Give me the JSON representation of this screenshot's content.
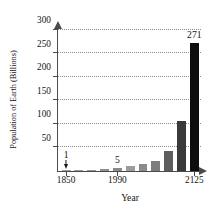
{
  "chart_data": {
    "type": "bar",
    "title": "",
    "xlabel": "Year",
    "ylabel": "Population of Earth (Billions)",
    "xlim": [
      1850,
      2145
    ],
    "ylim": [
      0,
      310
    ],
    "grid": true,
    "legend": false,
    "y_ticks": [
      50,
      100,
      150,
      200,
      250,
      300
    ],
    "y_tick_labels": [
      "50",
      "100",
      "150",
      "200",
      "250",
      "300"
    ],
    "x_ticks": [
      1850,
      1990,
      2125
    ],
    "x_tick_labels": [
      "1850",
      "1990",
      "2125"
    ],
    "categories": [
      "1850",
      "1875",
      "1925",
      "1965",
      "1990",
      "2015",
      "2040",
      "2065",
      "2090",
      "2105",
      "2125"
    ],
    "values": [
      1,
      1.5,
      2.5,
      4,
      5,
      11,
      14,
      20,
      43,
      105,
      271
    ],
    "bar_colors": [
      "#9e9e9e",
      "#9a9a9a",
      "#969696",
      "#8f8f8f",
      "#8a8a8a",
      "#9c9c9c",
      "#8a8a8a",
      "#7d7d7d",
      "#5e5e5e",
      "#3a3a3a",
      "#0d0d0d"
    ],
    "annotations": [
      {
        "text": "1",
        "value": 1,
        "category": "1850",
        "style": "arrow-down"
      },
      {
        "text": "5",
        "value": 5,
        "category": "1990",
        "style": "plain"
      },
      {
        "text": "271",
        "value": 271,
        "category": "2125",
        "style": "plain"
      }
    ]
  }
}
